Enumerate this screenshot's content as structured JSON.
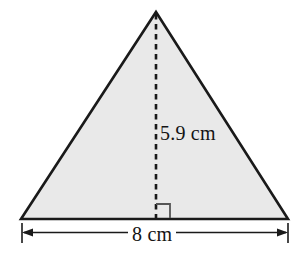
{
  "figure": {
    "shape": "triangle",
    "background_color": "#ffffff",
    "fill_color": "#e9e9e9",
    "stroke_color": "#1a1a1a",
    "dimension_line_color": "#1a1a1a",
    "vertices": {
      "apex": {
        "x": 156,
        "y": 12
      },
      "bottom_left": {
        "x": 21,
        "y": 219
      },
      "bottom_right": {
        "x": 288,
        "y": 219
      }
    },
    "height_line": {
      "name": "dashed-height-line",
      "style": "dashed",
      "from": {
        "x": 156,
        "y": 14
      },
      "to": {
        "x": 156,
        "y": 218
      }
    },
    "right_angle_marker": {
      "name": "right-angle-marker",
      "x": 156,
      "y": 204,
      "size": 14
    },
    "dimension_line": {
      "name": "base-dimension-line",
      "y": 232,
      "from_x": 22,
      "to_x": 288,
      "arrows": "both"
    },
    "labels": {
      "height": "5.9 cm",
      "base": "8 cm"
    }
  }
}
